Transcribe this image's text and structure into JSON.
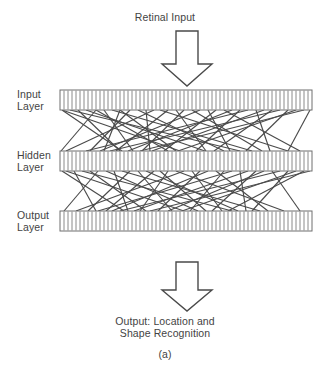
{
  "figure": {
    "title": "Retinal Input",
    "caption_line1": "Output: Location and",
    "caption_line2": "Shape Recognition",
    "subfigure_label": "(a)",
    "colors": {
      "background": "#ffffff",
      "text": "#434343",
      "arrow_stroke": "#4a4a4a",
      "bar_stroke": "#6e6e6e",
      "tick_stroke": "#8a8a8a",
      "connection_stroke": "#4a4a4a"
    }
  },
  "layers": [
    {
      "id": "input",
      "label_line1": "Input",
      "label_line2": "Layer",
      "cells": 63,
      "y_top": 90,
      "y_bottom": 110
    },
    {
      "id": "hidden",
      "label_line1": "Hidden",
      "label_line2": "Layer",
      "cells": 63,
      "y_top": 151,
      "y_bottom": 171
    },
    {
      "id": "output",
      "label_line1": "Output",
      "label_line2": "Layer",
      "cells": 63,
      "y_top": 211,
      "y_bottom": 231
    }
  ],
  "bar_geometry": {
    "x_left": 60,
    "x_right": 312
  },
  "arrows": [
    {
      "id": "retinal-input-arrow",
      "direction": "down",
      "cx": 187,
      "top": 31,
      "bottom": 86,
      "shaft_half_width": 11,
      "head_half_width": 25,
      "head_height": 22
    },
    {
      "id": "output-arrow",
      "direction": "down",
      "cx": 187,
      "top": 262,
      "bottom": 311,
      "shaft_half_width": 11,
      "head_half_width": 25,
      "head_height": 21
    }
  ],
  "chart_data": {
    "type": "diagram",
    "title": "Retinal Input",
    "connections_input_to_hidden": [
      [
        62,
        122
      ],
      [
        62,
        180
      ],
      [
        70,
        240
      ],
      [
        78,
        120
      ],
      [
        86,
        205
      ],
      [
        96,
        61
      ],
      [
        96,
        168
      ],
      [
        104,
        133
      ],
      [
        112,
        252
      ],
      [
        120,
        104
      ],
      [
        120,
        176
      ],
      [
        130,
        90
      ],
      [
        138,
        224
      ],
      [
        146,
        150
      ],
      [
        154,
        66
      ],
      [
        160,
        288
      ],
      [
        168,
        116
      ],
      [
        176,
        206
      ],
      [
        184,
        142
      ],
      [
        192,
        262
      ],
      [
        200,
        100
      ],
      [
        208,
        230
      ],
      [
        216,
        164
      ],
      [
        224,
        300
      ],
      [
        232,
        128
      ],
      [
        240,
        196
      ],
      [
        248,
        86
      ],
      [
        256,
        270
      ],
      [
        264,
        152
      ],
      [
        272,
        214
      ],
      [
        280,
        110
      ],
      [
        288,
        246
      ],
      [
        296,
        178
      ],
      [
        304,
        140
      ],
      [
        310,
        288
      ]
    ],
    "connections_hidden_to_output": [
      [
        62,
        124
      ],
      [
        66,
        184
      ],
      [
        74,
        96
      ],
      [
        82,
        232
      ],
      [
        90,
        146
      ],
      [
        98,
        64
      ],
      [
        106,
        198
      ],
      [
        114,
        128
      ],
      [
        122,
        260
      ],
      [
        130,
        88
      ],
      [
        138,
        172
      ],
      [
        146,
        238
      ],
      [
        154,
        106
      ],
      [
        160,
        206
      ],
      [
        168,
        140
      ],
      [
        176,
        284
      ],
      [
        184,
        76
      ],
      [
        192,
        222
      ],
      [
        200,
        158
      ],
      [
        208,
        112
      ],
      [
        216,
        268
      ],
      [
        224,
        190
      ],
      [
        232,
        98
      ],
      [
        240,
        246
      ],
      [
        248,
        134
      ],
      [
        256,
        212
      ],
      [
        264,
        168
      ],
      [
        272,
        300
      ],
      [
        280,
        120
      ],
      [
        288,
        252
      ],
      [
        296,
        182
      ],
      [
        304,
        228
      ],
      [
        310,
        150
      ]
    ]
  }
}
